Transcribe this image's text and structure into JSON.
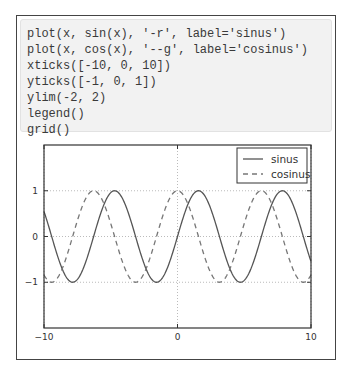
{
  "code": {
    "lines": [
      "plot(x, sin(x), '-r', label='sinus')",
      "plot(x, cos(x), '--g', label='cosinus')",
      "xticks([-10, 0, 10])",
      "yticks([-1, 0, 1])",
      "ylim(-2, 2)",
      "legend()",
      "grid()"
    ]
  },
  "colors": {
    "sinus": "#555555",
    "cosinus": "#777777",
    "grid": "#bbbbbb",
    "axes": "#333333"
  },
  "chart_data": {
    "type": "line",
    "title": "",
    "xlabel": "",
    "ylabel": "",
    "xlim": [
      -10,
      10
    ],
    "ylim": [
      -2,
      2
    ],
    "xticks": [
      -10,
      0,
      10
    ],
    "xtick_labels": [
      "−10",
      "0",
      "10"
    ],
    "yticks": [
      -1,
      0,
      1
    ],
    "ytick_labels": [
      "−1",
      "0",
      "1"
    ],
    "grid": true,
    "legend_position": "top-right",
    "series": [
      {
        "name": "sinus",
        "function": "sin(x)",
        "style": "solid"
      },
      {
        "name": "cosinus",
        "function": "cos(x)",
        "style": "dashed"
      }
    ]
  }
}
